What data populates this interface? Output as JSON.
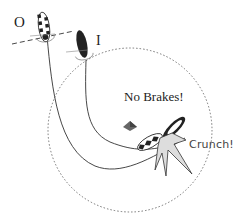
{
  "diagram": {
    "labels": {
      "outer_car": "O",
      "inner_car": "I",
      "caption": "No Brakes!",
      "impact": "Crunch!"
    },
    "colors": {
      "ink": "#222222",
      "dark_car": "#222222",
      "spark_fill": "#dddddd",
      "circle": "#666666",
      "marker": "#555555"
    },
    "elements": [
      {
        "name": "outer-car",
        "style": "checkered",
        "position": "top-left"
      },
      {
        "name": "inner-car",
        "style": "solid-dark",
        "position": "top-center"
      },
      {
        "name": "boundary-circle",
        "style": "dotted"
      },
      {
        "name": "center-marker",
        "shape": "pyramid"
      },
      {
        "name": "collision-burst",
        "style": "star"
      }
    ]
  }
}
